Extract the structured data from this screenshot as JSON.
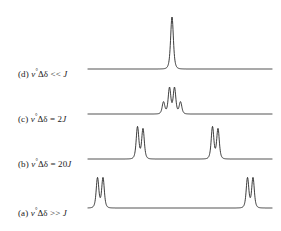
{
  "figure": {
    "background_color": "#ffffff",
    "trace_color": "#1a1a1a",
    "label_color": "#1a1a1a"
  },
  "traces": [
    {
      "id": "d",
      "label_prefix": "(d)",
      "label_expr": "ν°Δδ << J",
      "condition": "ν°Δδ << J",
      "label_x": 18,
      "label_y": 73,
      "baseline_y": 69,
      "baseline_x_start": 88,
      "baseline_x_end": 272,
      "pattern": "singlet",
      "peaks": [
        {
          "x": 172.0,
          "height": 52,
          "width": 2.0
        }
      ]
    },
    {
      "id": "c",
      "label_prefix": "(c)",
      "label_expr": "ν°Δδ = 2J",
      "condition": "ν°Δδ = 2J",
      "label_x": 18,
      "label_y": 118,
      "baseline_y": 114,
      "baseline_x_start": 88,
      "baseline_x_end": 272,
      "pattern": "ab-quartet",
      "peaks": [
        {
          "x": 163.5,
          "height": 12,
          "width": 1.9
        },
        {
          "x": 169.5,
          "height": 26,
          "width": 1.9
        },
        {
          "x": 174.5,
          "height": 26,
          "width": 1.9
        },
        {
          "x": 180.5,
          "height": 12,
          "width": 1.9
        }
      ]
    },
    {
      "id": "b",
      "label_prefix": "(b)",
      "label_expr": "ν°Δδ = 20J",
      "condition": "ν°Δδ = 20J",
      "label_x": 18,
      "label_y": 163,
      "baseline_y": 159,
      "baseline_x_start": 88,
      "baseline_x_end": 272,
      "pattern": "two-doublets",
      "peaks": [
        {
          "x": 137.5,
          "height": 32,
          "width": 1.9
        },
        {
          "x": 143.0,
          "height": 30,
          "width": 1.9
        },
        {
          "x": 212.5,
          "height": 32,
          "width": 1.9
        },
        {
          "x": 218.0,
          "height": 30,
          "width": 1.9
        }
      ]
    },
    {
      "id": "a",
      "label_prefix": "(a)",
      "label_expr": "ν°Δδ >> J",
      "condition": "ν°Δδ >> J",
      "label_x": 18,
      "label_y": 212,
      "baseline_y": 208,
      "baseline_x_start": 88,
      "baseline_x_end": 272,
      "pattern": "two-doublets",
      "peaks": [
        {
          "x": 97.5,
          "height": 30,
          "width": 1.9
        },
        {
          "x": 103.0,
          "height": 30,
          "width": 1.9
        },
        {
          "x": 247.5,
          "height": 30,
          "width": 1.9
        },
        {
          "x": 253.0,
          "height": 30,
          "width": 1.9
        }
      ]
    }
  ],
  "chart_data": {
    "type": "line",
    "title": "",
    "xlabel": "",
    "ylabel": "",
    "grid": false,
    "legend": "none",
    "series": [
      {
        "name": "(a) ν°Δδ >> J",
        "baseline_y": 208,
        "peak_x": [
          97.5,
          103.0,
          247.5,
          253.0
        ],
        "peak_heights": [
          30,
          30,
          30,
          30
        ]
      },
      {
        "name": "(b) ν°Δδ = 20J",
        "baseline_y": 159,
        "peak_x": [
          137.5,
          143.0,
          212.5,
          218.0
        ],
        "peak_heights": [
          32,
          30,
          32,
          30
        ]
      },
      {
        "name": "(c) ν°Δδ = 2J",
        "baseline_y": 114,
        "peak_x": [
          163.5,
          169.5,
          174.5,
          180.5
        ],
        "peak_heights": [
          12,
          26,
          26,
          12
        ]
      },
      {
        "name": "(d) ν°Δδ << J",
        "baseline_y": 69,
        "peak_x": [
          172.0
        ],
        "peak_heights": [
          52
        ]
      }
    ]
  }
}
